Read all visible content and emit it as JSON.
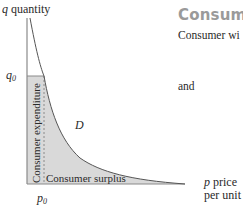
{
  "heading": "Consume",
  "body_lines": [
    "Consumer wi",
    "and"
  ],
  "axes": {
    "y_label_var": "q",
    "y_label_text": " quantity",
    "x_label_var": "p",
    "x_label_text_1": " price",
    "x_label_text_2": "per unit",
    "y_tick_var": "q",
    "y_tick_sub": "0",
    "x_tick_var": "p",
    "x_tick_sub": "0"
  },
  "curve_label": "D",
  "regions": {
    "expenditure": "Consumer expenditure",
    "surplus": "Consumer surplus"
  },
  "colors": {
    "shade": "#d9d9d9",
    "axis": "#8a8a8a",
    "curve": "#555555",
    "heading": "#9a9a9a"
  }
}
